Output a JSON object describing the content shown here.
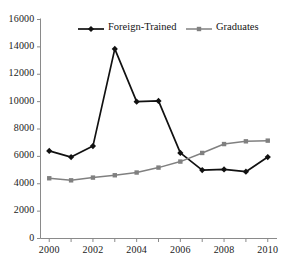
{
  "chart_data": {
    "type": "line",
    "title": "",
    "subtitle": "",
    "xlabel": "",
    "ylabel": "",
    "x": [
      2000,
      2001,
      2002,
      2003,
      2004,
      2005,
      2006,
      2007,
      2008,
      2009,
      2010
    ],
    "xlim": [
      1999.6,
      2010.4
    ],
    "ylim": [
      0,
      16000
    ],
    "xticks": [
      2000,
      2002,
      2004,
      2006,
      2008,
      2010
    ],
    "xtick_labels": [
      "2000",
      "2002",
      "2004",
      "2006",
      "2008",
      "2010"
    ],
    "xminor_ticks": [
      2000,
      2001,
      2002,
      2003,
      2004,
      2005,
      2006,
      2007,
      2008,
      2009,
      2010
    ],
    "yticks": [
      0,
      2000,
      4000,
      6000,
      8000,
      10000,
      12000,
      14000,
      16000
    ],
    "ytick_labels": [
      "0",
      "2000",
      "4000",
      "6000",
      "8000",
      "10000",
      "12000",
      "14000",
      "16000"
    ],
    "grid": false,
    "legend_position": "top-center",
    "series": [
      {
        "name": "Foreign-Trained",
        "color": "#111111",
        "marker": "diamond",
        "values": [
          6400,
          5950,
          6750,
          13850,
          10000,
          10050,
          6250,
          5000,
          5050,
          4880,
          5950
        ]
      },
      {
        "name": "Graduates",
        "color": "#808080",
        "marker": "square",
        "values": [
          4400,
          4250,
          4450,
          4620,
          4820,
          5180,
          5620,
          6250,
          6900,
          7100,
          7150
        ]
      }
    ]
  },
  "legend": {
    "items": [
      {
        "label": "Foreign-Trained",
        "color": "#111111",
        "marker": "diamond"
      },
      {
        "label": "Graduates",
        "color": "#808080",
        "marker": "square"
      }
    ]
  },
  "axes": {
    "y_axis_color": "#8a8a8a",
    "x_axis_color": "#8a8a8a"
  }
}
